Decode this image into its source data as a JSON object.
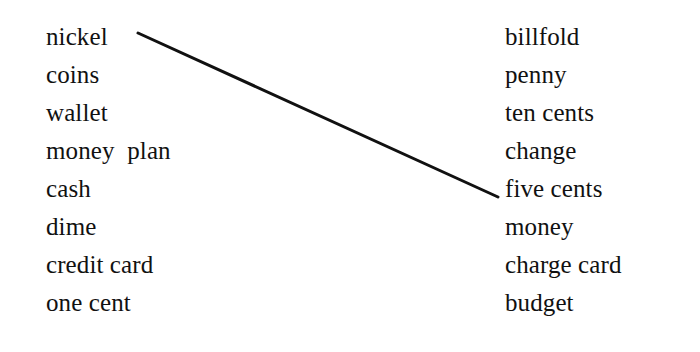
{
  "exercise": {
    "type": "matching-words-worksheet",
    "background_color": "#ffffff",
    "text_color": "#111111",
    "line_color": "#111111",
    "left_column": {
      "items": [
        {
          "label": "nickel"
        },
        {
          "label": "coins"
        },
        {
          "label": "wallet"
        },
        {
          "label": "money  plan"
        },
        {
          "label": "cash"
        },
        {
          "label": "dime"
        },
        {
          "label": "credit card"
        },
        {
          "label": "one cent"
        }
      ]
    },
    "right_column": {
      "items": [
        {
          "label": "billfold"
        },
        {
          "label": "penny"
        },
        {
          "label": "ten cents"
        },
        {
          "label": "change"
        },
        {
          "label": "five cents"
        },
        {
          "label": "money"
        },
        {
          "label": "charge card"
        },
        {
          "label": "budget"
        }
      ]
    },
    "connections": [
      {
        "from_label": "nickel",
        "to_label": "five cents",
        "from_index": 0,
        "to_index": 4,
        "x1": 138,
        "y1": 33,
        "x2": 498,
        "y2": 197,
        "stroke_width": 3
      }
    ]
  }
}
